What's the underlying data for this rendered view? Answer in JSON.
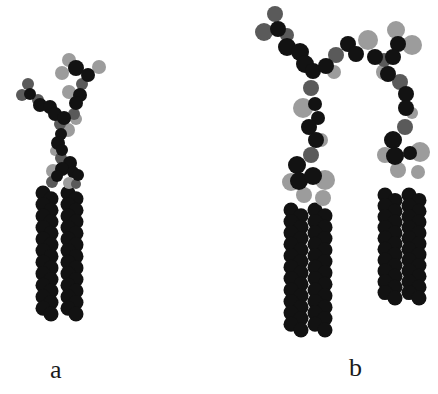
{
  "figure": {
    "panels": [
      {
        "id": "a",
        "label": "a",
        "description": "Molecular model, compact conformation",
        "chains": [
          {
            "x": 47,
            "y_start": 193,
            "y_end": 314,
            "beads": 11,
            "wobble": 4
          },
          {
            "x": 72,
            "y_start": 193,
            "y_end": 314,
            "beads": 11,
            "wobble": 4
          }
        ],
        "atoms": [
          {
            "x": 69,
            "y": 60,
            "r": 7,
            "c": "light"
          },
          {
            "x": 99,
            "y": 67,
            "r": 7,
            "c": "light"
          },
          {
            "x": 62,
            "y": 73,
            "r": 7,
            "c": "light"
          },
          {
            "x": 76,
            "y": 68,
            "r": 8,
            "c": "dark"
          },
          {
            "x": 88,
            "y": 75,
            "r": 7,
            "c": "dark"
          },
          {
            "x": 82,
            "y": 84,
            "r": 6,
            "c": "mid"
          },
          {
            "x": 80,
            "y": 95,
            "r": 7,
            "c": "dark"
          },
          {
            "x": 69,
            "y": 92,
            "r": 7,
            "c": "light"
          },
          {
            "x": 76,
            "y": 103,
            "r": 7,
            "c": "dark"
          },
          {
            "x": 74,
            "y": 114,
            "r": 6,
            "c": "mid"
          },
          {
            "x": 76,
            "y": 119,
            "r": 6,
            "c": "light"
          },
          {
            "x": 28,
            "y": 84,
            "r": 6,
            "c": "mid"
          },
          {
            "x": 22,
            "y": 95,
            "r": 6,
            "c": "mid"
          },
          {
            "x": 30,
            "y": 94,
            "r": 6,
            "c": "dark"
          },
          {
            "x": 38,
            "y": 100,
            "r": 6,
            "c": "mid"
          },
          {
            "x": 40,
            "y": 105,
            "r": 7,
            "c": "dark"
          },
          {
            "x": 50,
            "y": 107,
            "r": 7,
            "c": "dark"
          },
          {
            "x": 55,
            "y": 114,
            "r": 7,
            "c": "dark"
          },
          {
            "x": 64,
            "y": 118,
            "r": 7,
            "c": "dark"
          },
          {
            "x": 60,
            "y": 124,
            "r": 6,
            "c": "mid"
          },
          {
            "x": 68,
            "y": 130,
            "r": 7,
            "c": "light"
          },
          {
            "x": 61,
            "y": 134,
            "r": 6,
            "c": "dark"
          },
          {
            "x": 58,
            "y": 143,
            "r": 7,
            "c": "dark"
          },
          {
            "x": 62,
            "y": 150,
            "r": 6,
            "c": "dark"
          },
          {
            "x": 55,
            "y": 151,
            "r": 5,
            "c": "light"
          },
          {
            "x": 61,
            "y": 158,
            "r": 6,
            "c": "mid"
          },
          {
            "x": 70,
            "y": 163,
            "r": 7,
            "c": "dark"
          },
          {
            "x": 62,
            "y": 169,
            "r": 7,
            "c": "dark"
          },
          {
            "x": 73,
            "y": 172,
            "r": 6,
            "c": "dark"
          },
          {
            "x": 78,
            "y": 175,
            "r": 6,
            "c": "dark"
          },
          {
            "x": 53,
            "y": 171,
            "r": 7,
            "c": "light"
          },
          {
            "x": 57,
            "y": 176,
            "r": 6,
            "c": "dark"
          },
          {
            "x": 52,
            "y": 182,
            "r": 6,
            "c": "mid"
          },
          {
            "x": 69,
            "y": 183,
            "r": 6,
            "c": "light"
          },
          {
            "x": 76,
            "y": 184,
            "r": 5,
            "c": "mid"
          }
        ]
      },
      {
        "id": "b",
        "label": "b",
        "description": "Molecular model, extended conformation",
        "chains": [
          {
            "x": 296,
            "y_start": 210,
            "y_end": 330,
            "beads": 11,
            "wobble": 5
          },
          {
            "x": 320,
            "y_start": 210,
            "y_end": 330,
            "beads": 11,
            "wobble": 5
          },
          {
            "x": 390,
            "y_start": 195,
            "y_end": 298,
            "beads": 10,
            "wobble": 5
          },
          {
            "x": 414,
            "y_start": 195,
            "y_end": 298,
            "beads": 10,
            "wobble": 5
          }
        ],
        "atoms": [
          {
            "x": 275,
            "y": 14,
            "r": 8,
            "c": "mid"
          },
          {
            "x": 264,
            "y": 32,
            "r": 9,
            "c": "mid"
          },
          {
            "x": 278,
            "y": 29,
            "r": 8,
            "c": "dark"
          },
          {
            "x": 287,
            "y": 35,
            "r": 7,
            "c": "mid"
          },
          {
            "x": 287,
            "y": 47,
            "r": 9,
            "c": "dark"
          },
          {
            "x": 300,
            "y": 52,
            "r": 9,
            "c": "dark"
          },
          {
            "x": 305,
            "y": 64,
            "r": 9,
            "c": "dark"
          },
          {
            "x": 313,
            "y": 71,
            "r": 8,
            "c": "dark"
          },
          {
            "x": 326,
            "y": 66,
            "r": 8,
            "c": "dark"
          },
          {
            "x": 336,
            "y": 55,
            "r": 8,
            "c": "mid"
          },
          {
            "x": 334,
            "y": 72,
            "r": 7,
            "c": "light"
          },
          {
            "x": 348,
            "y": 44,
            "r": 8,
            "c": "dark"
          },
          {
            "x": 356,
            "y": 54,
            "r": 8,
            "c": "dark"
          },
          {
            "x": 368,
            "y": 40,
            "r": 10,
            "c": "light"
          },
          {
            "x": 375,
            "y": 57,
            "r": 8,
            "c": "dark"
          },
          {
            "x": 384,
            "y": 60,
            "r": 7,
            "c": "mid"
          },
          {
            "x": 396,
            "y": 30,
            "r": 9,
            "c": "light"
          },
          {
            "x": 412,
            "y": 45,
            "r": 10,
            "c": "light"
          },
          {
            "x": 398,
            "y": 44,
            "r": 8,
            "c": "dark"
          },
          {
            "x": 393,
            "y": 57,
            "r": 8,
            "c": "dark"
          },
          {
            "x": 384,
            "y": 72,
            "r": 8,
            "c": "light"
          },
          {
            "x": 388,
            "y": 74,
            "r": 8,
            "c": "dark"
          },
          {
            "x": 400,
            "y": 82,
            "r": 8,
            "c": "mid"
          },
          {
            "x": 406,
            "y": 94,
            "r": 8,
            "c": "dark"
          },
          {
            "x": 412,
            "y": 113,
            "r": 6,
            "c": "light"
          },
          {
            "x": 406,
            "y": 108,
            "r": 8,
            "c": "dark"
          },
          {
            "x": 405,
            "y": 127,
            "r": 8,
            "c": "mid"
          },
          {
            "x": 393,
            "y": 140,
            "r": 9,
            "c": "dark"
          },
          {
            "x": 385,
            "y": 155,
            "r": 8,
            "c": "light"
          },
          {
            "x": 395,
            "y": 156,
            "r": 9,
            "c": "dark"
          },
          {
            "x": 410,
            "y": 153,
            "r": 7,
            "c": "dark"
          },
          {
            "x": 420,
            "y": 152,
            "r": 10,
            "c": "light"
          },
          {
            "x": 398,
            "y": 170,
            "r": 8,
            "c": "light"
          },
          {
            "x": 418,
            "y": 172,
            "r": 7,
            "c": "light"
          },
          {
            "x": 311,
            "y": 88,
            "r": 8,
            "c": "mid"
          },
          {
            "x": 303,
            "y": 108,
            "r": 10,
            "c": "light"
          },
          {
            "x": 315,
            "y": 104,
            "r": 7,
            "c": "dark"
          },
          {
            "x": 318,
            "y": 118,
            "r": 7,
            "c": "dark"
          },
          {
            "x": 309,
            "y": 127,
            "r": 8,
            "c": "dark"
          },
          {
            "x": 321,
            "y": 140,
            "r": 7,
            "c": "light"
          },
          {
            "x": 316,
            "y": 140,
            "r": 8,
            "c": "dark"
          },
          {
            "x": 311,
            "y": 155,
            "r": 8,
            "c": "mid"
          },
          {
            "x": 297,
            "y": 165,
            "r": 9,
            "c": "dark"
          },
          {
            "x": 291,
            "y": 182,
            "r": 9,
            "c": "light"
          },
          {
            "x": 299,
            "y": 181,
            "r": 9,
            "c": "dark"
          },
          {
            "x": 313,
            "y": 176,
            "r": 9,
            "c": "dark"
          },
          {
            "x": 325,
            "y": 180,
            "r": 10,
            "c": "light"
          },
          {
            "x": 304,
            "y": 195,
            "r": 8,
            "c": "light"
          },
          {
            "x": 323,
            "y": 198,
            "r": 8,
            "c": "light"
          }
        ]
      }
    ],
    "colors": {
      "dark": "#121212",
      "mid": "#5a5a5a",
      "light": "#9c9c9c",
      "background": "#ffffff"
    }
  }
}
